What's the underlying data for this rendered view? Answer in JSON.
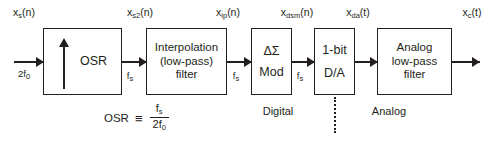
{
  "diagram": {
    "ink_color": "#231f20",
    "background": "#ffffff"
  },
  "blocks": [
    {
      "id": "osr",
      "lines": [
        "OSR"
      ],
      "symbol": "up-arrow-upsampler"
    },
    {
      "id": "interp",
      "lines": [
        "Interpolation",
        "(low-pass)",
        "filter"
      ],
      "symbol": "none"
    },
    {
      "id": "dsmod",
      "lines": [
        "ΔΣ",
        "Mod"
      ],
      "symbol": "none"
    },
    {
      "id": "dac",
      "lines": [
        "1-bit",
        "D/A"
      ],
      "symbol": "none"
    },
    {
      "id": "analoglpf",
      "lines": [
        "Analog",
        "low-pass",
        "filter"
      ],
      "symbol": "none"
    }
  ],
  "signal_labels": [
    {
      "id": "x_s",
      "base": "x",
      "sub": "s",
      "arg": "(n)"
    },
    {
      "id": "x_s2",
      "base": "x",
      "sub": "s2",
      "arg": "(n)"
    },
    {
      "id": "x_ip",
      "base": "x",
      "sub": "ip",
      "arg": "(n)"
    },
    {
      "id": "x_dsm",
      "base": "x",
      "sub": "dsm",
      "arg": "(n)"
    },
    {
      "id": "x_da",
      "base": "x",
      "sub": "da",
      "arg": "(t)"
    },
    {
      "id": "x_c",
      "base": "x",
      "sub": "c",
      "arg": "(t)"
    }
  ],
  "rate_labels": [
    {
      "id": "rate_in",
      "base": "2f",
      "sub": "0"
    },
    {
      "id": "rate_osr_out",
      "base": "f",
      "sub": "s"
    },
    {
      "id": "rate_ip_out",
      "base": "f",
      "sub": "s"
    },
    {
      "id": "rate_dsm_out",
      "base": "f",
      "sub": "s"
    }
  ],
  "formula": {
    "lhs": "OSR",
    "relation": "≡",
    "numerator_base": "f",
    "numerator_sub": "s",
    "denominator_base": "2f",
    "denominator_sub": "0"
  },
  "domains": [
    {
      "id": "digital",
      "label": "Digital"
    },
    {
      "id": "analog",
      "label": "Analog"
    }
  ]
}
